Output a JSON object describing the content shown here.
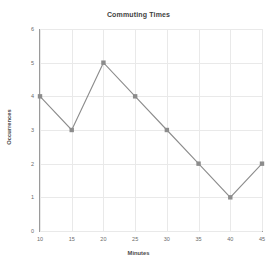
{
  "chart_data": {
    "type": "line",
    "title": "Commuting Times",
    "xlabel": "Minutes",
    "ylabel": "Occurrences",
    "x": [
      10,
      15,
      20,
      25,
      30,
      35,
      40,
      45
    ],
    "values": [
      4,
      3,
      5,
      4,
      3,
      2,
      1,
      2
    ],
    "series": [
      {
        "name": "Occurrences",
        "values": [
          4,
          3,
          5,
          4,
          3,
          2,
          1,
          2
        ]
      }
    ],
    "xlim": [
      10,
      45
    ],
    "ylim": [
      0,
      6
    ],
    "xticks": [
      10,
      15,
      20,
      25,
      30,
      35,
      40,
      45
    ],
    "yticks": [
      0,
      1,
      2,
      3,
      4,
      5,
      6
    ],
    "xtick_labels": [
      "10",
      "15",
      "20",
      "25",
      "30",
      "35",
      "40",
      "45"
    ],
    "ytick_labels": [
      "0",
      "1",
      "2",
      "3",
      "4",
      "5",
      "6"
    ],
    "grid": true,
    "legend": false,
    "legend_position": "none",
    "line_color": "#8c8c8c",
    "marker_color": "#8c8c8c",
    "marker": "square",
    "grid_color": "#e9e9e9",
    "axis_color": "#9a9a9a",
    "background_color": "#ffffff"
  }
}
